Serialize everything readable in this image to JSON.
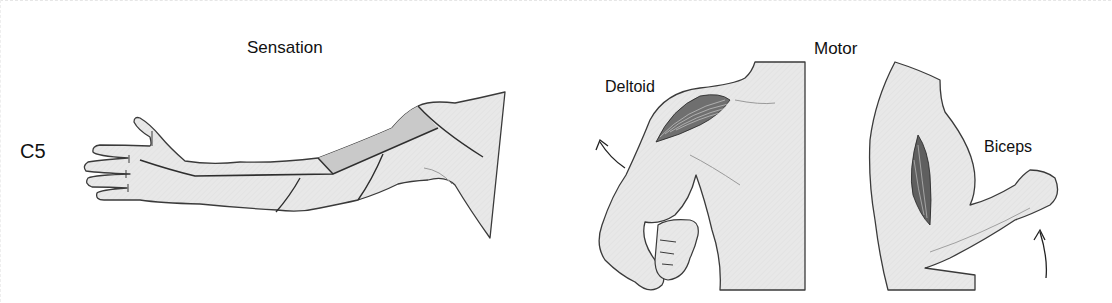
{
  "diagram": {
    "level": "C5",
    "sections": {
      "sensation": {
        "title": "Sensation"
      },
      "motor": {
        "title": "Motor",
        "muscles": [
          {
            "name": "Deltoid",
            "action": "shoulder abduction"
          },
          {
            "name": "Biceps",
            "action": "elbow flexion"
          }
        ]
      }
    },
    "colors": {
      "skin": "#e6e6e6",
      "dermatome_highlight": "#c9c9c9",
      "outline": "#3a3a3a",
      "text": "#111111"
    }
  }
}
